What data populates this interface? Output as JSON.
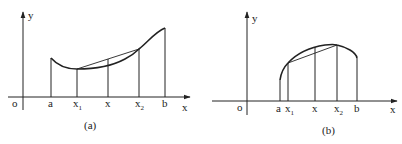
{
  "panels": [
    {
      "id": "a",
      "caption": "(a)",
      "description": "Convex curve on [a, b] with chord between x1 and x2 lying above the curve",
      "axes": {
        "x_label": "x",
        "y_label": "y",
        "origin_label": "o"
      },
      "ticks": [
        {
          "label": "a",
          "sub": ""
        },
        {
          "label": "x",
          "sub": "1"
        },
        {
          "label": "x",
          "sub": ""
        },
        {
          "label": "x",
          "sub": "2"
        },
        {
          "label": "b",
          "sub": ""
        }
      ]
    },
    {
      "id": "b",
      "caption": "(b)",
      "description": "Concave curve on [a, b] with chord between x1 and x2 lying below the curve",
      "axes": {
        "x_label": "x",
        "y_label": "y",
        "origin_label": "o"
      },
      "ticks": [
        {
          "label": "a",
          "sub": ""
        },
        {
          "label": "x",
          "sub": "1"
        },
        {
          "label": "x",
          "sub": ""
        },
        {
          "label": "x",
          "sub": "2"
        },
        {
          "label": "b",
          "sub": ""
        }
      ]
    }
  ]
}
